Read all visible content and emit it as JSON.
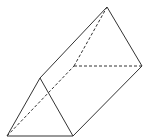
{
  "diagram": {
    "line_color": "#333333",
    "background": "#ffffff",
    "edges": {
      "visible": [
        "front-apex-to-front-left",
        "front-left-to-front-right",
        "front-apex-to-front-right",
        "front-apex-to-back-apex",
        "front-right-to-back-right",
        "back-apex-to-back-right"
      ],
      "hidden": [
        "front-left-to-back-left",
        "back-left-to-back-apex",
        "back-left-to-back-right"
      ]
    }
  }
}
